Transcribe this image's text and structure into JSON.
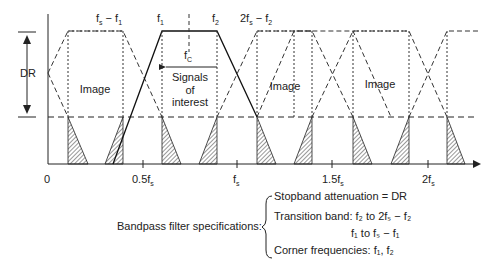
{
  "diagram": {
    "axis": {
      "origin_label": "0",
      "ticks": [
        {
          "label": "0.5f",
          "sub": "s"
        },
        {
          "label": "f",
          "sub": "s"
        },
        {
          "label": "1.5f",
          "sub": "s"
        },
        {
          "label": "2f",
          "sub": "s"
        }
      ]
    },
    "dr_label": "DR",
    "top_labels": {
      "fs_minus_f1": {
        "a": "f",
        "a_sub": "s",
        "mid": " − f",
        "b_sub": "1"
      },
      "f1": {
        "a": "f",
        "a_sub": "1"
      },
      "f2": {
        "a": "f",
        "a_sub": "2"
      },
      "two_fs_minus_f2": {
        "a": "2f",
        "a_sub": "s",
        "mid": " − f",
        "b_sub": "2"
      }
    },
    "fc_label": {
      "a": "f",
      "a_sub": "C"
    },
    "signals_label": [
      "Signals",
      "of",
      "interest"
    ],
    "image_labels": [
      "Image",
      "Image",
      "Image"
    ],
    "specs": {
      "heading": "Bandpass filter specifications:",
      "stopband": "Stopband  attenuation  =  DR",
      "transition_label": "Transition band: ",
      "transition_1": "f₂ to 2fₛ − f₂",
      "transition_2": "f₁ to fₛ − f₁",
      "corner": "Corner frequencies: f₁, f₂"
    },
    "colors": {
      "line": "#222222",
      "hatch": "#333333",
      "background": "#ffffff"
    }
  }
}
